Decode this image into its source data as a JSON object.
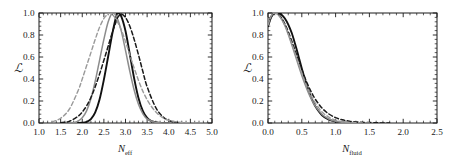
{
  "figure": {
    "background": "#ffffff",
    "panel_count": 2
  },
  "chart_data": [
    {
      "type": "line",
      "panel": "left",
      "title": "",
      "xlabel": "N_eff",
      "xlabel_base": "N",
      "xlabel_sub": "eff",
      "ylabel": "L",
      "xlim": [
        1.0,
        5.0
      ],
      "ylim": [
        0.0,
        1.0
      ],
      "xticks": [
        1.0,
        1.5,
        2.0,
        2.5,
        3.0,
        3.5,
        4.0,
        4.5,
        5.0
      ],
      "xticklabels": [
        "1.0",
        "1.5",
        "2.0",
        "2.5",
        "3.0",
        "3.5",
        "4.0",
        "4.5",
        "5.0"
      ],
      "yticks": [
        0.0,
        0.2,
        0.4,
        0.6,
        0.8,
        1.0
      ],
      "yticklabels": [
        "0.0",
        "0.2",
        "0.4",
        "0.6",
        "0.8",
        "1.0"
      ],
      "minor_ticks_per_interval": 5,
      "grid": false,
      "legend": "none",
      "frame": "box",
      "tick_direction": "in",
      "series": [
        {
          "name": "black-solid",
          "color": "#111111",
          "style": "solid",
          "width": 1.9,
          "peak_x": 2.82,
          "sigma": 0.23,
          "x": [
            1.9,
            2.0,
            2.1,
            2.2,
            2.3,
            2.4,
            2.5,
            2.6,
            2.7,
            2.8,
            2.82,
            2.9,
            3.0,
            3.1,
            3.2,
            3.3,
            3.4,
            3.5,
            3.6,
            3.8,
            4.0
          ],
          "values": [
            0.0,
            0.002,
            0.01,
            0.035,
            0.096,
            0.213,
            0.394,
            0.607,
            0.822,
            0.994,
            1.0,
            0.972,
            0.836,
            0.625,
            0.406,
            0.228,
            0.11,
            0.046,
            0.017,
            0.001,
            0.0
          ]
        },
        {
          "name": "gray-solid",
          "color": "#8c8c8c",
          "style": "solid",
          "width": 1.5,
          "peak_x": 2.7,
          "sigma": 0.27,
          "x": [
            1.7,
            1.8,
            1.9,
            2.0,
            2.1,
            2.2,
            2.3,
            2.4,
            2.5,
            2.6,
            2.7,
            2.8,
            2.9,
            3.0,
            3.1,
            3.2,
            3.3,
            3.4,
            3.5,
            3.7,
            3.9,
            4.1
          ],
          "values": [
            0.001,
            0.005,
            0.017,
            0.047,
            0.11,
            0.22,
            0.38,
            0.57,
            0.76,
            0.92,
            1.0,
            0.96,
            0.84,
            0.66,
            0.47,
            0.3,
            0.17,
            0.086,
            0.038,
            0.005,
            0.0,
            0.0
          ]
        },
        {
          "name": "black-dashed",
          "color": "#1a1a1a",
          "style": "dashed",
          "width": 1.5,
          "peak_x": 2.82,
          "sigma": 0.36,
          "x": [
            1.5,
            1.7,
            1.9,
            2.0,
            2.1,
            2.2,
            2.3,
            2.4,
            2.5,
            2.6,
            2.7,
            2.8,
            2.82,
            2.9,
            3.0,
            3.1,
            3.2,
            3.3,
            3.4,
            3.5,
            3.7,
            3.9,
            4.1,
            4.3
          ],
          "values": [
            0.002,
            0.015,
            0.06,
            0.1,
            0.155,
            0.232,
            0.33,
            0.445,
            0.57,
            0.7,
            0.83,
            0.94,
            0.96,
            0.99,
            0.96,
            0.88,
            0.76,
            0.62,
            0.47,
            0.33,
            0.14,
            0.045,
            0.01,
            0.001
          ]
        },
        {
          "name": "gray-dashed",
          "color": "#9a9a9a",
          "style": "dashed",
          "width": 1.4,
          "peak_x": 2.62,
          "sigma": 0.48,
          "x": [
            1.3,
            1.5,
            1.7,
            1.9,
            2.0,
            2.1,
            2.2,
            2.3,
            2.4,
            2.5,
            2.6,
            2.62,
            2.7,
            2.8,
            2.9,
            3.0,
            3.2,
            3.4,
            3.6,
            3.8,
            4.0,
            4.3,
            4.6,
            4.85
          ],
          "values": [
            0.01,
            0.043,
            0.125,
            0.29,
            0.4,
            0.52,
            0.64,
            0.76,
            0.87,
            0.95,
            0.995,
            1.0,
            0.985,
            0.93,
            0.85,
            0.74,
            0.5,
            0.29,
            0.15,
            0.065,
            0.024,
            0.005,
            0.001,
            0.0
          ]
        }
      ]
    },
    {
      "type": "line",
      "panel": "right",
      "title": "",
      "xlabel": "N_fluid",
      "xlabel_base": "N",
      "xlabel_sub": "fluid",
      "ylabel": "L",
      "xlim": [
        0.0,
        2.5
      ],
      "ylim": [
        0.0,
        1.0
      ],
      "xticks": [
        0.0,
        0.5,
        1.0,
        1.5,
        2.0,
        2.5
      ],
      "xticklabels": [
        "0.0",
        "0.5",
        "1.0",
        "1.5",
        "2.0",
        "2.5"
      ],
      "yticks": [
        0.0,
        0.2,
        0.4,
        0.6,
        0.8,
        1.0
      ],
      "yticklabels": [
        "0.0",
        "0.2",
        "0.4",
        "0.6",
        "0.8",
        "1.0"
      ],
      "minor_ticks_per_interval": 5,
      "grid": false,
      "legend": "none",
      "frame": "box",
      "tick_direction": "in",
      "series": [
        {
          "name": "black-solid",
          "color": "#111111",
          "style": "solid",
          "width": 1.9,
          "peak_x": 0.15,
          "x": [
            0.0,
            0.05,
            0.1,
            0.15,
            0.2,
            0.25,
            0.3,
            0.35,
            0.4,
            0.45,
            0.5,
            0.55,
            0.6,
            0.65,
            0.7,
            0.8,
            0.9,
            1.0,
            1.1,
            1.2,
            1.3,
            1.45
          ],
          "values": [
            0.88,
            0.965,
            0.998,
            1.0,
            0.985,
            0.95,
            0.895,
            0.82,
            0.72,
            0.61,
            0.495,
            0.39,
            0.295,
            0.215,
            0.152,
            0.07,
            0.03,
            0.012,
            0.005,
            0.002,
            0.001,
            0.0
          ]
        },
        {
          "name": "gray-solid",
          "color": "#8c8c8c",
          "style": "solid",
          "width": 1.5,
          "peak_x": 0.1,
          "x": [
            0.0,
            0.05,
            0.1,
            0.15,
            0.2,
            0.25,
            0.3,
            0.35,
            0.4,
            0.45,
            0.5,
            0.55,
            0.6,
            0.65,
            0.7,
            0.8,
            0.9,
            1.0,
            1.1,
            1.2,
            1.3,
            1.45
          ],
          "values": [
            0.89,
            0.975,
            1.0,
            0.985,
            0.945,
            0.885,
            0.805,
            0.715,
            0.62,
            0.525,
            0.432,
            0.348,
            0.272,
            0.207,
            0.153,
            0.078,
            0.036,
            0.015,
            0.006,
            0.002,
            0.001,
            0.0
          ]
        },
        {
          "name": "black-dashed",
          "color": "#1a1a1a",
          "style": "dashed",
          "width": 1.5,
          "peak_x": 0.1,
          "x": [
            0.0,
            0.05,
            0.1,
            0.15,
            0.2,
            0.25,
            0.3,
            0.35,
            0.4,
            0.45,
            0.5,
            0.55,
            0.6,
            0.65,
            0.7,
            0.8,
            0.9,
            1.0,
            1.1,
            1.2,
            1.35,
            1.5,
            1.65,
            1.8
          ],
          "values": [
            0.885,
            0.972,
            1.0,
            0.99,
            0.955,
            0.9,
            0.83,
            0.748,
            0.66,
            0.572,
            0.485,
            0.405,
            0.333,
            0.27,
            0.216,
            0.135,
            0.082,
            0.049,
            0.029,
            0.017,
            0.008,
            0.004,
            0.001,
            0.0
          ]
        },
        {
          "name": "gray-dashed",
          "color": "#9a9a9a",
          "style": "dashed",
          "width": 1.4,
          "peak_x": 0.1,
          "x": [
            0.0,
            0.05,
            0.1,
            0.15,
            0.2,
            0.25,
            0.3,
            0.35,
            0.4,
            0.45,
            0.5,
            0.55,
            0.6,
            0.65,
            0.7,
            0.8,
            0.9,
            1.0,
            1.1,
            1.25,
            1.4,
            1.55
          ],
          "values": [
            0.89,
            0.975,
            1.0,
            0.985,
            0.945,
            0.888,
            0.812,
            0.726,
            0.635,
            0.545,
            0.455,
            0.372,
            0.298,
            0.234,
            0.18,
            0.1,
            0.053,
            0.026,
            0.012,
            0.004,
            0.001,
            0.0
          ]
        }
      ]
    }
  ]
}
